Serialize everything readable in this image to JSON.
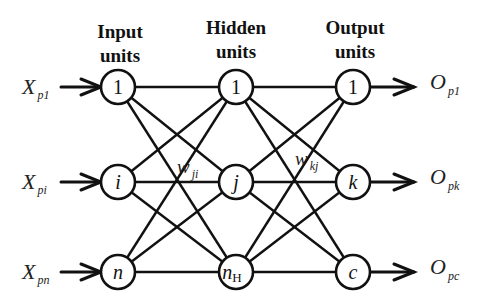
{
  "headers": {
    "input": [
      "Input",
      "units"
    ],
    "hidden": [
      "Hidden",
      "units"
    ],
    "output": [
      "Output",
      "units"
    ]
  },
  "layers": {
    "input": [
      {
        "label": "1",
        "italic": false,
        "sub": ""
      },
      {
        "label": "i",
        "italic": true,
        "sub": ""
      },
      {
        "label": "n",
        "italic": true,
        "sub": ""
      }
    ],
    "hidden": [
      {
        "label": "1",
        "italic": false,
        "sub": ""
      },
      {
        "label": "j",
        "italic": true,
        "sub": ""
      },
      {
        "label": "n",
        "italic": true,
        "sub": "H"
      }
    ],
    "output": [
      {
        "label": "1",
        "italic": false,
        "sub": ""
      },
      {
        "label": "k",
        "italic": true,
        "sub": ""
      },
      {
        "label": "c",
        "italic": true,
        "sub": ""
      }
    ]
  },
  "inputs": [
    {
      "base": "X",
      "sub": "p1"
    },
    {
      "base": "X",
      "sub": "pi"
    },
    {
      "base": "X",
      "sub": "pn"
    }
  ],
  "outputs": [
    {
      "base": "O",
      "sub": "p1"
    },
    {
      "base": "O",
      "sub": "pk"
    },
    {
      "base": "O",
      "sub": "pc"
    }
  ],
  "weights": {
    "input_hidden": {
      "base": "w",
      "sub": "ji"
    },
    "hidden_output": {
      "base": "w",
      "sub": "kj"
    }
  },
  "connectivity": "fully-connected"
}
